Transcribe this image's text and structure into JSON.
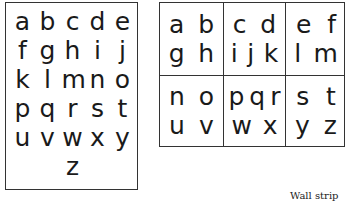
{
  "alphabet_card": {
    "rows": [
      [
        "a",
        "b",
        "c",
        "d",
        "e"
      ],
      [
        "f",
        "g",
        "h",
        "i",
        "j"
      ],
      [
        "k",
        "l",
        "m",
        "n",
        "o"
      ],
      [
        "p",
        "q",
        "r",
        "s",
        "t"
      ],
      [
        "u",
        "v",
        "w",
        "x",
        "y"
      ],
      [
        "z"
      ]
    ]
  },
  "alphabet_grid": {
    "cells": [
      {
        "top": [
          "a",
          "b"
        ],
        "bottom": [
          "g",
          "h"
        ]
      },
      {
        "top": [
          "c",
          "d"
        ],
        "bottom": [
          "i",
          "j",
          "k"
        ]
      },
      {
        "top": [
          "e",
          "f"
        ],
        "bottom": [
          "l",
          "m"
        ]
      },
      {
        "top": [
          "n",
          "o"
        ],
        "bottom": [
          "u",
          "v"
        ]
      },
      {
        "top": [
          "p",
          "q",
          "r"
        ],
        "bottom": [
          "w",
          "x"
        ]
      },
      {
        "top": [
          "s",
          "t"
        ],
        "bottom": [
          "y",
          "z"
        ]
      }
    ]
  },
  "caption": "Wall strip"
}
